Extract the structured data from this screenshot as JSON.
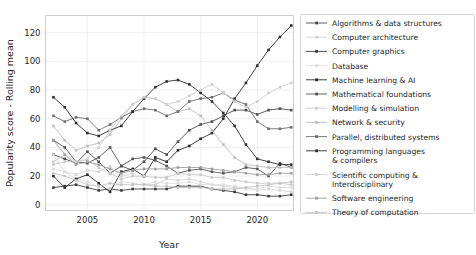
{
  "chart_data": {
    "type": "line",
    "title": "",
    "xlabel": "Year",
    "ylabel": "Popularity score - Rolling mean",
    "xlim": [
      2001.3,
      2023.2
    ],
    "ylim": [
      -4,
      132
    ],
    "xticks": [
      2005,
      2010,
      2015,
      2020
    ],
    "yticks": [
      0,
      20,
      40,
      60,
      80,
      100,
      120
    ],
    "grid": true,
    "legend_position": "right-outside",
    "x": [
      2002,
      2003,
      2004,
      2005,
      2006,
      2007,
      2008,
      2009,
      2010,
      2011,
      2012,
      2013,
      2014,
      2015,
      2016,
      2017,
      2018,
      2019,
      2020,
      2021,
      2022,
      2023
    ],
    "series": [
      {
        "name": "Algorithms & data structures",
        "color": "#4d4d4d",
        "values": [
          35,
          32,
          29,
          37,
          30,
          22,
          27,
          24,
          30,
          39,
          35,
          44,
          52,
          56,
          58,
          62,
          66,
          66,
          63,
          66,
          67,
          66
        ]
      },
      {
        "name": "Computer architecture",
        "color": "#d4d4d4",
        "values": [
          35,
          23,
          21,
          24,
          23,
          27,
          20,
          22,
          14,
          14,
          18,
          17,
          18,
          16,
          14,
          13,
          12,
          12,
          10,
          11,
          10,
          9
        ]
      },
      {
        "name": "Computer graphics",
        "color": "#3d3d3d",
        "values": [
          12,
          13,
          14,
          12,
          10,
          11,
          10,
          11,
          11,
          11,
          11,
          13,
          13,
          13,
          11,
          10,
          9,
          7,
          7,
          6,
          6,
          7
        ]
      },
      {
        "name": "Database",
        "color": "#dcdcdc",
        "values": [
          25,
          23,
          18,
          16,
          12,
          11,
          16,
          15,
          14,
          16,
          15,
          15,
          16,
          14,
          14,
          14,
          13,
          11,
          11,
          13,
          12,
          12
        ]
      },
      {
        "name": "Machine learning & AI",
        "color": "#2b2b2b",
        "values": [
          20,
          12,
          18,
          21,
          15,
          9,
          23,
          25,
          20,
          33,
          30,
          38,
          41,
          46,
          50,
          60,
          74,
          85,
          97,
          108,
          117,
          125
        ]
      },
      {
        "name": "Mathematical foundations",
        "color": "#555555",
        "values": [
          45,
          40,
          30,
          29,
          33,
          40,
          27,
          32,
          33,
          31,
          27,
          22,
          24,
          25,
          23,
          22,
          23,
          26,
          25,
          20,
          29,
          26
        ]
      },
      {
        "name": "Modelling & simulation",
        "color": "#c9c9c9",
        "values": [
          28,
          30,
          30,
          31,
          26,
          22,
          18,
          20,
          20,
          19,
          19,
          22,
          21,
          21,
          19,
          19,
          17,
          16,
          15,
          15,
          15,
          14
        ]
      },
      {
        "name": "Network & security",
        "color": "#bdbdbd",
        "values": [
          55,
          45,
          38,
          41,
          43,
          49,
          60,
          70,
          75,
          74,
          70,
          65,
          67,
          62,
          52,
          42,
          33,
          28,
          27,
          26,
          26,
          26
        ]
      },
      {
        "name": "Parallel, distributed systems",
        "color": "#6e6e6e",
        "values": [
          62,
          58,
          61,
          60,
          52,
          56,
          61,
          65,
          67,
          66,
          62,
          65,
          72,
          74,
          75,
          78,
          73,
          70,
          58,
          53,
          53,
          54
        ]
      },
      {
        "name": "Programming languages & compilers",
        "color": "#303030",
        "values": [
          75,
          68,
          57,
          50,
          48,
          52,
          55,
          65,
          74,
          82,
          86,
          87,
          84,
          78,
          72,
          64,
          55,
          42,
          32,
          30,
          28,
          28
        ]
      },
      {
        "name": "Scientific computing & Interdisciplinary",
        "color": "#cfcfcf",
        "values": [
          30,
          35,
          30,
          32,
          40,
          52,
          62,
          70,
          75,
          74,
          70,
          72,
          76,
          80,
          84,
          78,
          72,
          68,
          72,
          78,
          82,
          85
        ]
      },
      {
        "name": "Software engineering",
        "color": "#9e9e9e",
        "values": [
          45,
          35,
          28,
          30,
          28,
          25,
          22,
          24,
          25,
          25,
          25,
          26,
          26,
          26,
          25,
          24,
          23,
          22,
          21,
          21,
          22,
          22
        ]
      },
      {
        "name": "Theory of computation",
        "color": "#c4c4c4",
        "values": [
          22,
          20,
          17,
          14,
          13,
          15,
          14,
          14,
          14,
          13,
          13,
          12,
          12,
          12,
          11,
          11,
          11,
          12,
          13,
          14,
          15,
          16
        ]
      }
    ]
  },
  "legend": {
    "items": [
      {
        "label": "Algorithms & data structures"
      },
      {
        "label": "Computer architecture"
      },
      {
        "label": "Computer graphics"
      },
      {
        "label": "Database"
      },
      {
        "label": "Machine learning & AI"
      },
      {
        "label": "Mathematical foundations"
      },
      {
        "label": "Modelling & simulation"
      },
      {
        "label": "Network & security"
      },
      {
        "label": "Parallel, distributed systems"
      },
      {
        "label": "Programming languages",
        "label2": " & compilers"
      },
      {
        "label": "Scientific computing &",
        "label2": " Interdisciplinary"
      },
      {
        "label": "Software engineering"
      },
      {
        "label": "Theory of computation"
      }
    ]
  }
}
